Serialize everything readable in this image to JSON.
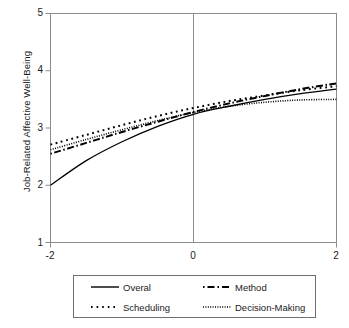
{
  "chart_data": {
    "type": "line",
    "title": "",
    "xlabel": "",
    "ylabel": "Job-Related Affective Well-Being",
    "xlim": [
      -2,
      2
    ],
    "ylim": [
      1,
      5
    ],
    "xticks": [
      "-2",
      "0",
      "2"
    ],
    "xtick_values": [
      -2,
      0,
      2
    ],
    "yticks": [
      "1",
      "2",
      "3",
      "4",
      "5"
    ],
    "ytick_values": [
      1,
      2,
      3,
      4,
      5
    ],
    "grid": false,
    "legend_position": "bottom",
    "reference_line_x": 0,
    "x": [
      -2,
      -1.5,
      -1,
      -0.5,
      0,
      0.5,
      1,
      1.5,
      2
    ],
    "series": [
      {
        "name": "Overal",
        "style": "solid",
        "color": "#000000",
        "values": [
          2.0,
          2.43,
          2.76,
          3.03,
          3.24,
          3.38,
          3.5,
          3.6,
          3.68
        ]
      },
      {
        "name": "Method",
        "style": "dash-dot",
        "color": "#000000",
        "values": [
          2.55,
          2.74,
          2.93,
          3.11,
          3.28,
          3.43,
          3.56,
          3.68,
          3.78
        ]
      },
      {
        "name": "Scheduling",
        "style": "coarse-dotted",
        "color": "#000000",
        "values": [
          2.71,
          2.88,
          3.05,
          3.21,
          3.35,
          3.47,
          3.57,
          3.66,
          3.73
        ]
      },
      {
        "name": "Decision-Making",
        "style": "fine-dotted",
        "color": "#000000",
        "values": [
          2.62,
          2.8,
          2.97,
          3.13,
          3.27,
          3.38,
          3.45,
          3.49,
          3.5
        ]
      }
    ]
  },
  "legend": {
    "entries": [
      {
        "label": "Overal"
      },
      {
        "label": "Method"
      },
      {
        "label": "Scheduling"
      },
      {
        "label": "Decision-Making"
      }
    ]
  },
  "axes": {
    "y_title": "Job-Related Affective Well-Being",
    "y_tick_5": "5",
    "y_tick_4": "4",
    "y_tick_3": "3",
    "y_tick_2": "2",
    "y_tick_1": "1",
    "x_tick_left": "-2",
    "x_tick_mid": "0",
    "x_tick_right": "2"
  },
  "colors": {
    "axis": "#8c8c8c",
    "line": "#000000",
    "text": "#1a1a1a",
    "background": "#ffffff"
  }
}
